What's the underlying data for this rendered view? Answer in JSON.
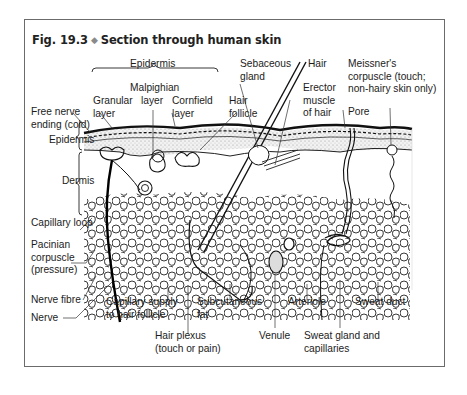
{
  "figure": {
    "number": "Fig. 19.3",
    "separator": "◆",
    "title": "Section through human skin"
  },
  "labels": {
    "epidermis_top": "Epidermis",
    "malpighian_1": "Malpighian",
    "malpighian_2": "layer",
    "granular_1": "Granular",
    "granular_2": "layer",
    "cornfield_1": "Cornfield",
    "cornfield_2": "layer",
    "free_nerve_1": "Free nerve",
    "free_nerve_2": "ending (cold)",
    "epidermis_left": "Epidermis",
    "dermis": "Dermis",
    "hair_follicle_1": "Hair",
    "hair_follicle_2": "follicle",
    "sebaceous_1": "Sebaceous",
    "sebaceous_2": "gland",
    "hair": "Hair",
    "erector_1": "Erector",
    "erector_2": "muscle",
    "erector_3": "of hair",
    "meissner_1": "Meissner's",
    "meissner_2": "corpuscle (touch;",
    "meissner_3": "non-hairy skin only)",
    "pore": "Pore",
    "capillary_loop": "Capillary loop",
    "pacinian_1": "Pacinian",
    "pacinian_2": "corpuscle",
    "pacinian_3": "(pressure)",
    "nerve_fibre": "Nerve fibre",
    "nerve": "Nerve",
    "cap_supply_1": "Capillary supply",
    "cap_supply_2": "to hair follicle",
    "subcut_1": "Subcutaneous",
    "subcut_2": "fat",
    "hair_plexus_1": "Hair plexus",
    "hair_plexus_2": "(touch or pain)",
    "arteriole": "Arteriole",
    "venule": "Venule",
    "sweat_duct": "Sweat duct",
    "sweat_gland_1": "Sweat gland and",
    "sweat_gland_2": "capillaries"
  },
  "colors": {
    "frame": "#6b6b6b",
    "ink": "#1a1a1a",
    "diamond": "#8a8a8a",
    "stipple": "#d9d9d9"
  }
}
